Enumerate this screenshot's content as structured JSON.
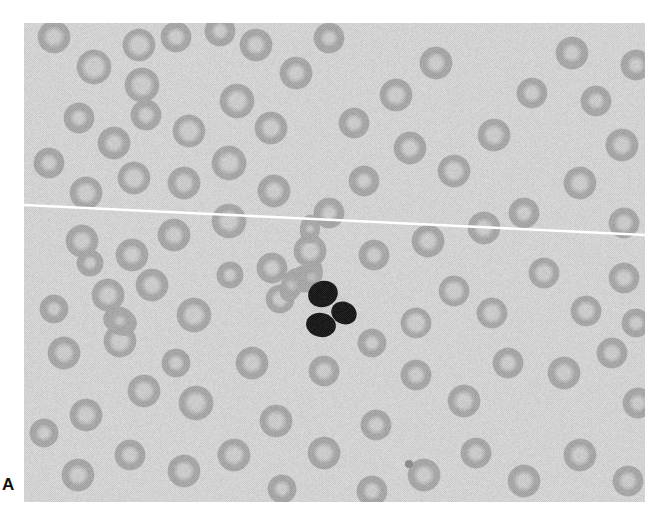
{
  "figure": {
    "kind": "photomicrograph",
    "panel_label": "A",
    "stain": "grayscale",
    "background_color": "#d2d2d2",
    "border_color": "#ffffff",
    "frame": {
      "x": 24,
      "y": 23,
      "width": 621,
      "height": 479
    }
  },
  "artifacts": {
    "scratch_line": {
      "name": "white-diagonal-scratch",
      "color": "#ffffff",
      "x1": 0,
      "y1": 182,
      "x2": 621,
      "y2": 212,
      "thickness": 2.5
    }
  },
  "cells": {
    "white_blood_cell": {
      "name": "segmented-neutrophil",
      "cx": 306,
      "cy": 283,
      "radius": 24,
      "nucleus_color": "#1c1c1c",
      "lobes": [
        {
          "cx": 299,
          "cy": 271,
          "rx": 15,
          "ry": 13,
          "rot": -20
        },
        {
          "cx": 320,
          "cy": 290,
          "rx": 13,
          "ry": 11,
          "rot": 25
        },
        {
          "cx": 297,
          "cy": 302,
          "rx": 15,
          "ry": 12,
          "rot": 10
        }
      ]
    },
    "platelet": {
      "name": "platelet",
      "cx": 385,
      "cy": 441,
      "radius": 4,
      "color": "#8c8c8c"
    },
    "red_blood_cells": {
      "fill_color": "#a6a6a6",
      "pallor_color": "#c9c9c9",
      "edge_color": "#9a9a9a",
      "mean_diameter": 33,
      "items": [
        {
          "cx": 30,
          "cy": 14,
          "r": 17,
          "p": 0.32
        },
        {
          "cx": 70,
          "cy": 44,
          "r": 18,
          "p": 0.42
        },
        {
          "cx": 115,
          "cy": 22,
          "r": 17,
          "p": 0.4
        },
        {
          "cx": 152,
          "cy": 14,
          "r": 16,
          "p": 0.3
        },
        {
          "cx": 118,
          "cy": 62,
          "r": 18,
          "p": 0.38
        },
        {
          "cx": 196,
          "cy": 8,
          "r": 16,
          "p": 0.25
        },
        {
          "cx": 232,
          "cy": 22,
          "r": 17,
          "p": 0.3
        },
        {
          "cx": 213,
          "cy": 78,
          "r": 18,
          "p": 0.36
        },
        {
          "cx": 165,
          "cy": 108,
          "r": 17,
          "p": 0.4
        },
        {
          "cx": 122,
          "cy": 92,
          "r": 16,
          "p": 0.28
        },
        {
          "cx": 90,
          "cy": 120,
          "r": 17,
          "p": 0.3
        },
        {
          "cx": 55,
          "cy": 95,
          "r": 16,
          "p": 0.26
        },
        {
          "cx": 272,
          "cy": 50,
          "r": 17,
          "p": 0.3
        },
        {
          "cx": 305,
          "cy": 15,
          "r": 16,
          "p": 0.25
        },
        {
          "cx": 247,
          "cy": 105,
          "r": 17,
          "p": 0.34
        },
        {
          "cx": 205,
          "cy": 140,
          "r": 18,
          "p": 0.36
        },
        {
          "cx": 160,
          "cy": 160,
          "r": 17,
          "p": 0.32
        },
        {
          "cx": 110,
          "cy": 155,
          "r": 17,
          "p": 0.38
        },
        {
          "cx": 62,
          "cy": 170,
          "r": 17,
          "p": 0.36
        },
        {
          "cx": 25,
          "cy": 140,
          "r": 16,
          "p": 0.28
        },
        {
          "cx": 250,
          "cy": 168,
          "r": 17,
          "p": 0.3
        },
        {
          "cx": 205,
          "cy": 198,
          "r": 18,
          "p": 0.34
        },
        {
          "cx": 150,
          "cy": 212,
          "r": 17,
          "p": 0.3
        },
        {
          "cx": 108,
          "cy": 232,
          "r": 17,
          "p": 0.3
        },
        {
          "cx": 58,
          "cy": 218,
          "r": 17,
          "p": 0.32
        },
        {
          "cx": 330,
          "cy": 100,
          "r": 16,
          "p": 0.28
        },
        {
          "cx": 372,
          "cy": 72,
          "r": 17,
          "p": 0.34
        },
        {
          "cx": 412,
          "cy": 40,
          "r": 17,
          "p": 0.3
        },
        {
          "cx": 386,
          "cy": 125,
          "r": 17,
          "p": 0.32
        },
        {
          "cx": 340,
          "cy": 158,
          "r": 16,
          "p": 0.26
        },
        {
          "cx": 430,
          "cy": 148,
          "r": 17,
          "p": 0.36
        },
        {
          "cx": 470,
          "cy": 112,
          "r": 17,
          "p": 0.34
        },
        {
          "cx": 508,
          "cy": 70,
          "r": 16,
          "p": 0.3
        },
        {
          "cx": 548,
          "cy": 30,
          "r": 17,
          "p": 0.28
        },
        {
          "cx": 572,
          "cy": 78,
          "r": 16,
          "p": 0.26
        },
        {
          "cx": 598,
          "cy": 122,
          "r": 17,
          "p": 0.32
        },
        {
          "cx": 556,
          "cy": 160,
          "r": 17,
          "p": 0.34
        },
        {
          "cx": 500,
          "cy": 190,
          "r": 16,
          "p": 0.28
        },
        {
          "cx": 460,
          "cy": 205,
          "r": 17,
          "p": 0.3
        },
        {
          "cx": 404,
          "cy": 218,
          "r": 17,
          "p": 0.32
        },
        {
          "cx": 350,
          "cy": 232,
          "r": 16,
          "p": 0.28
        },
        {
          "cx": 305,
          "cy": 190,
          "r": 16,
          "p": 0.26
        },
        {
          "cx": 612,
          "cy": 42,
          "r": 16,
          "p": 0.26
        },
        {
          "cx": 600,
          "cy": 200,
          "r": 16,
          "p": 0.3
        },
        {
          "cx": 286,
          "cy": 228,
          "r": 17,
          "p": 0.34
        },
        {
          "cx": 248,
          "cy": 245,
          "r": 16,
          "p": 0.28
        },
        {
          "cx": 84,
          "cy": 272,
          "r": 17,
          "p": 0.34
        },
        {
          "cx": 128,
          "cy": 262,
          "r": 17,
          "p": 0.32
        },
        {
          "cx": 170,
          "cy": 292,
          "r": 18,
          "p": 0.36
        },
        {
          "cx": 96,
          "cy": 318,
          "r": 17,
          "p": 0.38
        },
        {
          "cx": 40,
          "cy": 330,
          "r": 17,
          "p": 0.32
        },
        {
          "cx": 30,
          "cy": 286,
          "r": 15,
          "p": 0.24
        },
        {
          "cx": 120,
          "cy": 368,
          "r": 17,
          "p": 0.34
        },
        {
          "cx": 172,
          "cy": 380,
          "r": 18,
          "p": 0.36
        },
        {
          "cx": 62,
          "cy": 392,
          "r": 17,
          "p": 0.34
        },
        {
          "cx": 228,
          "cy": 340,
          "r": 17,
          "p": 0.32
        },
        {
          "cx": 256,
          "cy": 276,
          "r": 15,
          "p": 0.3
        },
        {
          "cx": 280,
          "cy": 256,
          "r": 14,
          "p": 0.28
        },
        {
          "cx": 392,
          "cy": 300,
          "r": 16,
          "p": 0.4
        },
        {
          "cx": 430,
          "cy": 268,
          "r": 16,
          "p": 0.38
        },
        {
          "cx": 468,
          "cy": 290,
          "r": 16,
          "p": 0.36
        },
        {
          "cx": 520,
          "cy": 250,
          "r": 16,
          "p": 0.34
        },
        {
          "cx": 562,
          "cy": 288,
          "r": 16,
          "p": 0.34
        },
        {
          "cx": 600,
          "cy": 255,
          "r": 16,
          "p": 0.32
        },
        {
          "cx": 392,
          "cy": 352,
          "r": 16,
          "p": 0.3
        },
        {
          "cx": 440,
          "cy": 378,
          "r": 17,
          "p": 0.34
        },
        {
          "cx": 484,
          "cy": 340,
          "r": 16,
          "p": 0.3
        },
        {
          "cx": 540,
          "cy": 350,
          "r": 17,
          "p": 0.32
        },
        {
          "cx": 588,
          "cy": 330,
          "r": 16,
          "p": 0.3
        },
        {
          "cx": 614,
          "cy": 380,
          "r": 16,
          "p": 0.28
        },
        {
          "cx": 348,
          "cy": 320,
          "r": 15,
          "p": 0.26
        },
        {
          "cx": 300,
          "cy": 348,
          "r": 16,
          "p": 0.3
        },
        {
          "cx": 252,
          "cy": 398,
          "r": 17,
          "p": 0.34
        },
        {
          "cx": 300,
          "cy": 430,
          "r": 17,
          "p": 0.32
        },
        {
          "cx": 210,
          "cy": 432,
          "r": 17,
          "p": 0.34
        },
        {
          "cx": 160,
          "cy": 448,
          "r": 17,
          "p": 0.32
        },
        {
          "cx": 106,
          "cy": 432,
          "r": 16,
          "p": 0.3
        },
        {
          "cx": 54,
          "cy": 452,
          "r": 17,
          "p": 0.32
        },
        {
          "cx": 20,
          "cy": 410,
          "r": 15,
          "p": 0.26
        },
        {
          "cx": 352,
          "cy": 402,
          "r": 16,
          "p": 0.3
        },
        {
          "cx": 400,
          "cy": 452,
          "r": 17,
          "p": 0.32
        },
        {
          "cx": 348,
          "cy": 468,
          "r": 16,
          "p": 0.28
        },
        {
          "cx": 452,
          "cy": 430,
          "r": 16,
          "p": 0.3
        },
        {
          "cx": 500,
          "cy": 458,
          "r": 17,
          "p": 0.32
        },
        {
          "cx": 556,
          "cy": 432,
          "r": 17,
          "p": 0.34
        },
        {
          "cx": 604,
          "cy": 458,
          "r": 16,
          "p": 0.3
        },
        {
          "cx": 612,
          "cy": 300,
          "r": 15,
          "p": 0.26
        },
        {
          "cx": 258,
          "cy": 466,
          "r": 15,
          "p": 0.26
        },
        {
          "cx": 152,
          "cy": 340,
          "r": 15,
          "p": 0.26
        },
        {
          "cx": 206,
          "cy": 252,
          "r": 14,
          "p": 0.24
        },
        {
          "cx": 66,
          "cy": 240,
          "r": 14,
          "p": 0.22
        }
      ]
    },
    "oval_cells": {
      "name": "elongated-red-cells",
      "items": [
        {
          "cx": 268,
          "cy": 262,
          "rx": 18,
          "ry": 11,
          "rot": 112
        },
        {
          "cx": 288,
          "cy": 254,
          "rx": 17,
          "ry": 10,
          "rot": 108
        },
        {
          "cx": 286,
          "cy": 206,
          "rx": 15,
          "ry": 10,
          "rot": 95
        },
        {
          "cx": 96,
          "cy": 298,
          "rx": 18,
          "ry": 14,
          "rot": 30
        }
      ]
    }
  }
}
